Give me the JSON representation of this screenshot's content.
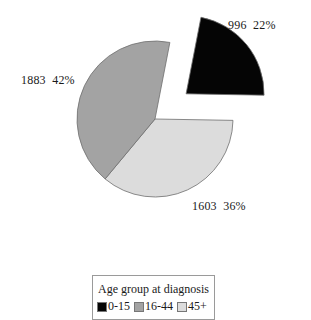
{
  "chart_data": {
    "type": "pie",
    "title": "",
    "categories": [
      "0-15",
      "16-44",
      "45+"
    ],
    "values": [
      996,
      1883,
      1603
    ],
    "percentages": [
      22,
      42,
      36
    ],
    "colors": [
      "#050505",
      "#a3a3a3",
      "#dcdcdc"
    ],
    "exploded": [
      "0-15"
    ],
    "legend": {
      "title": "Age group at diagnosis",
      "position": "bottom",
      "entries": [
        "0-15",
        "16-44",
        "45+"
      ]
    }
  },
  "labels": {
    "slice_0": "996  22%",
    "slice_1": "1883  42%",
    "slice_2": "1603  36%"
  },
  "legend": {
    "title": "Age group at diagnosis",
    "items": [
      {
        "label": "0-15",
        "color": "#050505"
      },
      {
        "label": "16-44",
        "color": "#a3a3a3"
      },
      {
        "label": "45+",
        "color": "#dcdcdc"
      }
    ]
  }
}
